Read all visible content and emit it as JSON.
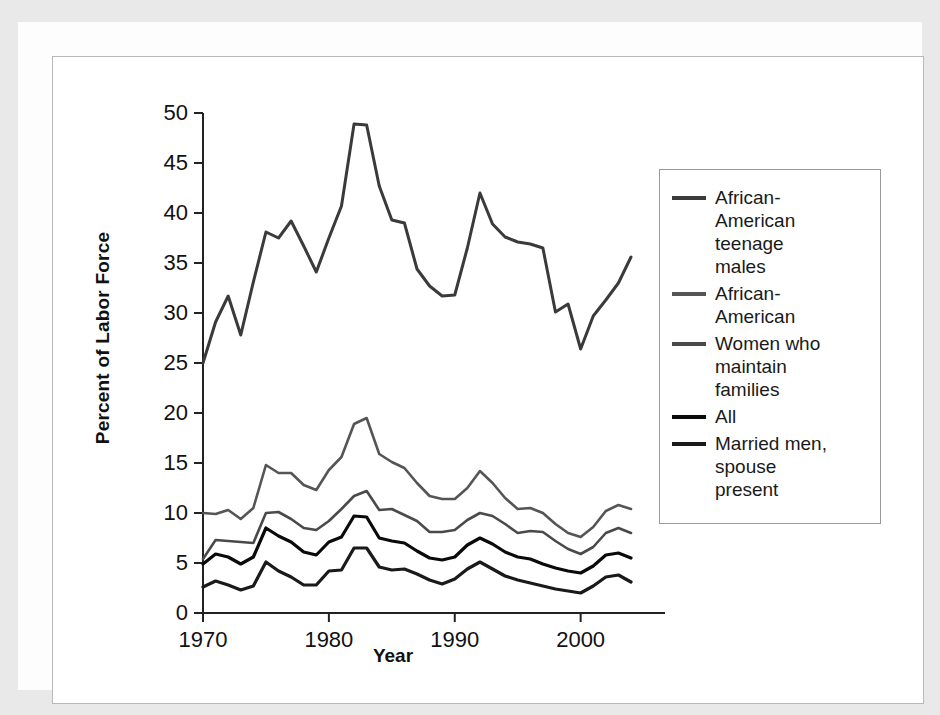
{
  "axes": {
    "ylabel": "Percent of Labor Force",
    "xlabel": "Year",
    "y_ticks": [
      "0",
      "5",
      "10",
      "15",
      "20",
      "25",
      "30",
      "35",
      "40",
      "45",
      "50"
    ],
    "x_ticks": [
      "1970",
      "1980",
      "1990",
      "2000"
    ]
  },
  "legend": {
    "items": [
      {
        "label": "African-\nAmerican\nteenage\nmales",
        "color": "#3a3a3a"
      },
      {
        "label": "African-\nAmerican",
        "color": "#555555"
      },
      {
        "label": "Women who\nmaintain\nfamilies",
        "color": "#4a4a4a"
      },
      {
        "label": "All",
        "color": "#0a0a0a"
      },
      {
        "label": "Married men,\nspouse\npresent",
        "color": "#1a1a1a"
      }
    ]
  },
  "chart_data": {
    "type": "line",
    "title": "",
    "xlabel": "Year",
    "ylabel": "Percent of Labor Force",
    "xlim": [
      1970,
      2004
    ],
    "ylim": [
      0,
      50
    ],
    "grid": false,
    "legend_position": "right",
    "x": [
      1970,
      1971,
      1972,
      1973,
      1974,
      1975,
      1976,
      1977,
      1978,
      1979,
      1980,
      1981,
      1982,
      1983,
      1984,
      1985,
      1986,
      1987,
      1988,
      1989,
      1990,
      1991,
      1992,
      1993,
      1994,
      1995,
      1996,
      1997,
      1998,
      1999,
      2000,
      2001,
      2002,
      2003,
      2004
    ],
    "series": [
      {
        "name": "African-American teenage males",
        "color": "#3a3a3a",
        "width": 3.0,
        "values": [
          25.0,
          29.1,
          31.7,
          27.8,
          33.1,
          38.1,
          37.5,
          39.2,
          36.7,
          34.1,
          37.5,
          40.7,
          48.9,
          48.8,
          42.7,
          39.3,
          39.0,
          34.4,
          32.7,
          31.7,
          31.8,
          36.5,
          42.0,
          38.9,
          37.6,
          37.1,
          36.9,
          36.5,
          30.1,
          30.9,
          26.4,
          29.7,
          31.3,
          33.0,
          35.6
        ]
      },
      {
        "name": "African-American",
        "color": "#555555",
        "width": 2.6,
        "values": [
          10.0,
          9.9,
          10.3,
          9.4,
          10.5,
          14.8,
          14.0,
          14.0,
          12.8,
          12.3,
          14.3,
          15.6,
          18.9,
          19.5,
          15.9,
          15.1,
          14.5,
          13.0,
          11.7,
          11.4,
          11.4,
          12.5,
          14.2,
          13.0,
          11.5,
          10.4,
          10.5,
          10.0,
          8.9,
          8.0,
          7.6,
          8.6,
          10.2,
          10.8,
          10.4
        ]
      },
      {
        "name": "Women who maintain families",
        "color": "#4a4a4a",
        "width": 2.6,
        "values": [
          5.4,
          7.3,
          7.2,
          7.1,
          7.0,
          10.0,
          10.1,
          9.4,
          8.5,
          8.3,
          9.2,
          10.4,
          11.7,
          12.2,
          10.3,
          10.4,
          9.8,
          9.2,
          8.1,
          8.1,
          8.3,
          9.3,
          10.0,
          9.7,
          8.9,
          8.0,
          8.2,
          8.1,
          7.2,
          6.4,
          5.9,
          6.6,
          8.0,
          8.5,
          8.0
        ]
      },
      {
        "name": "All",
        "color": "#0a0a0a",
        "width": 3.2,
        "values": [
          4.9,
          5.9,
          5.6,
          4.9,
          5.6,
          8.5,
          7.7,
          7.1,
          6.1,
          5.8,
          7.1,
          7.6,
          9.7,
          9.6,
          7.5,
          7.2,
          7.0,
          6.2,
          5.5,
          5.3,
          5.6,
          6.8,
          7.5,
          6.9,
          6.1,
          5.6,
          5.4,
          4.9,
          4.5,
          4.2,
          4.0,
          4.7,
          5.8,
          6.0,
          5.5
        ]
      },
      {
        "name": "Married men, spouse present",
        "color": "#1a1a1a",
        "width": 3.2,
        "values": [
          2.6,
          3.2,
          2.8,
          2.3,
          2.7,
          5.1,
          4.2,
          3.6,
          2.8,
          2.8,
          4.2,
          4.3,
          6.5,
          6.5,
          4.6,
          4.3,
          4.4,
          3.9,
          3.3,
          2.9,
          3.4,
          4.4,
          5.1,
          4.4,
          3.7,
          3.3,
          3.0,
          2.7,
          2.4,
          2.2,
          2.0,
          2.7,
          3.6,
          3.8,
          3.1
        ]
      }
    ]
  }
}
